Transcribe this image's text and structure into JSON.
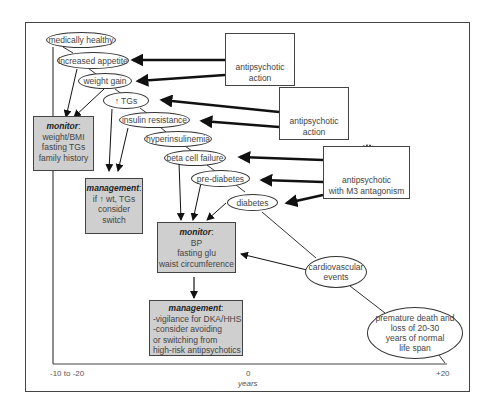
{
  "diagram": {
    "nodes": {
      "medically_healthy": "medically healthy",
      "increased_appetite": "increased appetite",
      "weight_gain": "weight gain",
      "tgs_arrow": "↑",
      "tgs": "TGs",
      "insulin_resistance": "insulin resistance",
      "hyperinsulinemia": "hyperinsulinemia",
      "beta_cell_failure": "beta cell failure",
      "pre_diabetes": "pre-diabetes",
      "diabetes": "diabetes",
      "cardiovascular_events": [
        "cardiovascular",
        "events"
      ],
      "premature_death": [
        "premature death and",
        "loss of 20-30",
        "years of normal",
        "life span"
      ]
    },
    "drug_boxes": [
      {
        "icon": "antipsychotic-molecule-icon",
        "lines": [
          "antipsychotic",
          "action"
        ]
      },
      {
        "icon": "antipsychotic-molecule-icon",
        "lines": [
          "antipsychotic",
          "action"
        ]
      },
      {
        "icon": "antipsychotic-molecule-icon",
        "lines": [
          "antipsychotic",
          "with M3 antagonism"
        ]
      }
    ],
    "monitor_1": {
      "title": "monitor",
      "colon": ":",
      "lines": [
        "weight/BMI",
        "fasting TGs",
        "family history"
      ]
    },
    "management_1": {
      "title": "management",
      "colon": ":",
      "lines": [
        "if ↑ wt, TGs",
        "consider",
        "switch"
      ]
    },
    "monitor_2": {
      "title": "monitor",
      "colon": ":",
      "lines": [
        "BP",
        "fasting glu",
        "waist circumference"
      ]
    },
    "management_2": {
      "title": "management",
      "colon": ":",
      "lines": [
        "-vigilance for DKA/HHS",
        "-consider avoiding",
        "or switching from",
        "high-risk antipsychotics"
      ]
    },
    "axis": {
      "left": "-10 to -20",
      "center": "0",
      "center_unit": "years",
      "right": "+20"
    }
  },
  "colors": {
    "box_fill": "#cfcfcf",
    "stroke": "#333333",
    "arrow": "#111111"
  }
}
